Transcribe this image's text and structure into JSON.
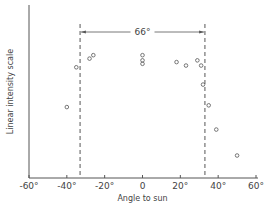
{
  "chart_data": {
    "type": "scatter",
    "title": "",
    "xlabel": "Angle to sun",
    "ylabel": "Linear intensity scale",
    "xlim": [
      -60,
      60
    ],
    "ylim": [
      0,
      100
    ],
    "x_ticks": [
      -60,
      -40,
      -20,
      0,
      20,
      40,
      60
    ],
    "x_tick_labels": [
      "-60°",
      "-40°",
      "-20°",
      "0",
      "20°",
      "40°",
      "60°"
    ],
    "y_ticks": [],
    "grid": false,
    "legend": null,
    "series": [
      {
        "name": "intensity",
        "marker": "open-circle",
        "points": [
          {
            "x": -40,
            "y": 41
          },
          {
            "x": -35,
            "y": 64
          },
          {
            "x": -28,
            "y": 69
          },
          {
            "x": -26,
            "y": 71
          },
          {
            "x": 0,
            "y": 71
          },
          {
            "x": 0,
            "y": 68
          },
          {
            "x": 0,
            "y": 66
          },
          {
            "x": 18,
            "y": 67
          },
          {
            "x": 23,
            "y": 65
          },
          {
            "x": 29,
            "y": 68
          },
          {
            "x": 31,
            "y": 65
          },
          {
            "x": 32,
            "y": 54
          },
          {
            "x": 35,
            "y": 42
          },
          {
            "x": 39,
            "y": 28
          },
          {
            "x": 50,
            "y": 13
          }
        ]
      }
    ],
    "annotations": [
      {
        "type": "vline",
        "x": -33,
        "style": "dashed"
      },
      {
        "type": "vline",
        "x": 33,
        "style": "dashed"
      },
      {
        "type": "double-arrow",
        "x_from": -33,
        "x_to": 33,
        "label": "66°"
      }
    ]
  },
  "colors": {
    "axis": "#555555",
    "marker": "#555555",
    "text": "#444444"
  }
}
